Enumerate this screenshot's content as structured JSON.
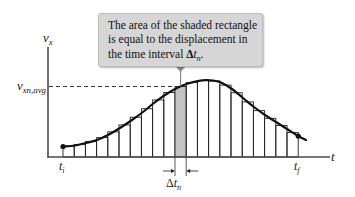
{
  "figure": {
    "callout": {
      "line1": "The area of the shaded rectangle",
      "line2": "is equal to the displacement in",
      "line3": "the time interval ",
      "delta": "Δ",
      "var": "t",
      "sub": "n",
      "end": "."
    },
    "y_axis_label": {
      "main": "v",
      "sub": "x"
    },
    "x_axis_label": "t",
    "avg_label": {
      "main": "v",
      "sub": "xn,avg"
    },
    "t_initial": {
      "main": "t",
      "sub": "i"
    },
    "t_final": {
      "main": "t",
      "sub": "f"
    },
    "interval_label": {
      "delta": "Δ",
      "main": "t",
      "sub": "n"
    },
    "bars": {
      "count": 21,
      "x_start": 63,
      "x_end": 298.2,
      "shaded_index": 10,
      "baseline_y": 157
    },
    "curve_points": [
      [
        63,
        146.5
      ],
      [
        75,
        145.5
      ],
      [
        86,
        143
      ],
      [
        97,
        140
      ],
      [
        108,
        135
      ],
      [
        120,
        128
      ],
      [
        132,
        120
      ],
      [
        143,
        112
      ],
      [
        154,
        103
      ],
      [
        165,
        95
      ],
      [
        177,
        88
      ],
      [
        188,
        83.5
      ],
      [
        199,
        80.8
      ],
      [
        206,
        80.2
      ],
      [
        213,
        80.6
      ],
      [
        221,
        82.5
      ],
      [
        232,
        89
      ],
      [
        243,
        98
      ],
      [
        254,
        107
      ],
      [
        265,
        115
      ],
      [
        276,
        122
      ],
      [
        287,
        129
      ],
      [
        298,
        136
      ],
      [
        306,
        140
      ]
    ],
    "colors": {
      "curve": "#111111",
      "bar_stroke": "#222222",
      "shaded": "#c4c4c4",
      "callout_bg": "#d6d6d6",
      "pointer": "#8c8c8c",
      "axis": "#4a4a4a"
    }
  }
}
